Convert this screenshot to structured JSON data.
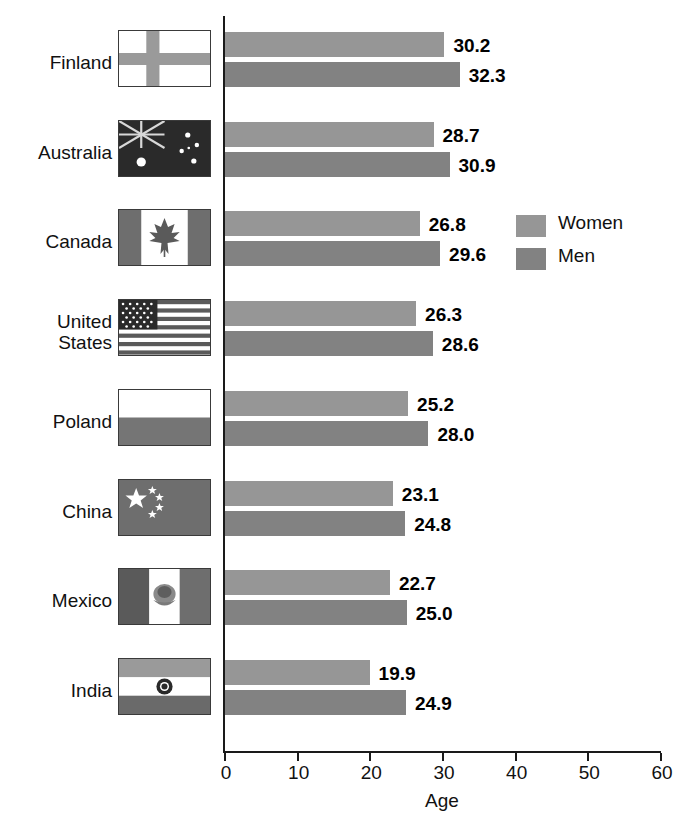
{
  "chart_data": {
    "type": "bar",
    "orientation": "horizontal",
    "title": "",
    "xlabel": "Age",
    "ylabel": "",
    "xlim": [
      0,
      60
    ],
    "xticks": [
      0,
      10,
      20,
      30,
      40,
      50,
      60
    ],
    "grid": false,
    "legend_position": "inside-right",
    "categories": [
      "Finland",
      "Australia",
      "Canada",
      "United States",
      "Poland",
      "China",
      "Mexico",
      "India"
    ],
    "category_labels_multiline": {
      "United States": [
        "United",
        "States"
      ]
    },
    "series": [
      {
        "name": "Women",
        "color": "#969696",
        "values": [
          30.2,
          28.7,
          26.8,
          26.3,
          25.2,
          23.1,
          22.7,
          19.9
        ]
      },
      {
        "name": "Men",
        "color": "#828282",
        "values": [
          32.3,
          30.9,
          29.6,
          28.6,
          28.0,
          24.8,
          25.0,
          24.9
        ]
      }
    ],
    "value_labels": [
      "30.2",
      "32.3",
      "28.7",
      "30.9",
      "26.8",
      "29.6",
      "26.3",
      "28.6",
      "25.2",
      "28.0",
      "23.1",
      "24.8",
      "22.7",
      "25.0",
      "19.9",
      "24.9"
    ],
    "flags": [
      "finland-flag",
      "australia-flag",
      "canada-flag",
      "united-states-flag",
      "poland-flag",
      "china-flag",
      "mexico-flag",
      "india-flag"
    ]
  },
  "axis": {
    "xlabel": "Age",
    "ticks": [
      {
        "label": "0"
      },
      {
        "label": "10"
      },
      {
        "label": "20"
      },
      {
        "label": "30"
      },
      {
        "label": "40"
      },
      {
        "label": "50"
      },
      {
        "label": "60"
      }
    ]
  },
  "legend": {
    "items": [
      {
        "label": "Women",
        "color": "#969696"
      },
      {
        "label": "Men",
        "color": "#828282"
      }
    ]
  },
  "rows": [
    {
      "country": "Finland",
      "line1": "Finland",
      "line2": "",
      "flag": "finland-flag",
      "women": 30.2,
      "men": 32.3,
      "women_label": "30.2",
      "men_label": "32.3"
    },
    {
      "country": "Australia",
      "line1": "Australia",
      "line2": "",
      "flag": "australia-flag",
      "women": 28.7,
      "men": 30.9,
      "women_label": "28.7",
      "men_label": "30.9"
    },
    {
      "country": "Canada",
      "line1": "Canada",
      "line2": "",
      "flag": "canada-flag",
      "women": 26.8,
      "men": 29.6,
      "women_label": "26.8",
      "men_label": "29.6"
    },
    {
      "country": "United States",
      "line1": "United",
      "line2": "States",
      "flag": "united-states-flag",
      "women": 26.3,
      "men": 28.6,
      "women_label": "26.3",
      "men_label": "28.6"
    },
    {
      "country": "Poland",
      "line1": "Poland",
      "line2": "",
      "flag": "poland-flag",
      "women": 25.2,
      "men": 28.0,
      "women_label": "25.2",
      "men_label": "28.0"
    },
    {
      "country": "China",
      "line1": "China",
      "line2": "",
      "flag": "china-flag",
      "women": 23.1,
      "men": 24.8,
      "women_label": "23.1",
      "men_label": "24.8"
    },
    {
      "country": "Mexico",
      "line1": "Mexico",
      "line2": "",
      "flag": "mexico-flag",
      "women": 22.7,
      "men": 25.0,
      "women_label": "22.7",
      "men_label": "25.0"
    },
    {
      "country": "India",
      "line1": "India",
      "line2": "",
      "flag": "india-flag",
      "women": 19.9,
      "men": 24.9,
      "women_label": "19.9",
      "men_label": "24.9"
    }
  ],
  "colors": {
    "women_bar": "#969696",
    "men_bar": "#828282",
    "axis": "#1a1a1a",
    "text": "#111111",
    "background": "#ffffff"
  }
}
